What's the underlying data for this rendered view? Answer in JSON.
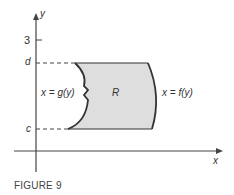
{
  "figure": {
    "caption": "FIGURE 9",
    "axes": {
      "x_label": "x",
      "y_label": "y"
    },
    "ticks": {
      "y_tick_3": "3"
    },
    "levels": {
      "d": "d",
      "c": "c"
    },
    "region_label": "R",
    "left_curve_label": "x = g(y)",
    "right_curve_label": "x = f(y)",
    "colors": {
      "region_fill": "#dedede",
      "curve": "#333333",
      "axis": "#444444"
    }
  }
}
